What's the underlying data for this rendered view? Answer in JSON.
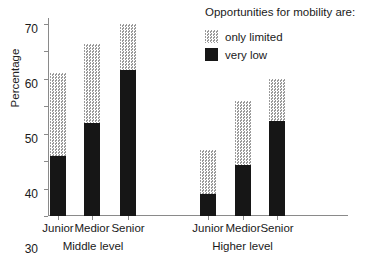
{
  "chart_data": {
    "type": "bar",
    "subtype": "stacked",
    "title": "",
    "xlabel": "",
    "ylabel": "Percentage",
    "ylim": [
      0,
      72
    ],
    "yticks": [
      0,
      10,
      20,
      30,
      40,
      50,
      60,
      70
    ],
    "ytick_labels": [
      "0",
      "10",
      "20",
      "30",
      "40",
      "50",
      "60",
      "70"
    ],
    "grid": false,
    "legend_title": "Opportunities for mobility are:",
    "legend_position": "top-right",
    "categories": [
      "Junior",
      "Medior",
      "Senior",
      "Junior",
      "Medior",
      "Senior"
    ],
    "groups": [
      {
        "label": "Middle level",
        "categories": [
          "Junior",
          "Medior",
          "Senior"
        ]
      },
      {
        "label": "Higher level",
        "categories": [
          "Junior",
          "Medior",
          "Senior"
        ]
      }
    ],
    "series": [
      {
        "name": "very low",
        "color": "#161616",
        "values": [
          22,
          34,
          53,
          8,
          18.5,
          34.5
        ]
      },
      {
        "name": "only limited",
        "color": "#d9d9d9",
        "values": [
          30,
          28.5,
          17,
          16,
          23.5,
          15.5
        ]
      }
    ],
    "totals": [
      52,
      62.5,
      70,
      24,
      42,
      50
    ]
  },
  "axis": {
    "y_title": "Percentage"
  },
  "legend": {
    "title": "Opportunities for mobility are:",
    "items": [
      {
        "label": "only limited",
        "swatch": "limited"
      },
      {
        "label": "very low",
        "swatch": "low"
      }
    ]
  },
  "x_axis": {
    "tick_labels": [
      "Junior",
      "Medior",
      "Senior",
      "Junior",
      "Medior",
      "Senior"
    ],
    "group_labels": [
      "Middle level",
      "Higher level"
    ]
  }
}
